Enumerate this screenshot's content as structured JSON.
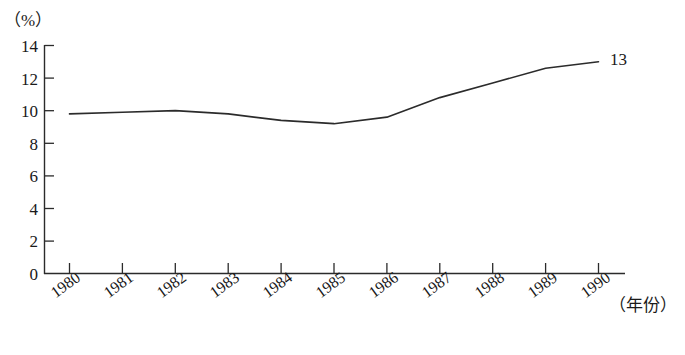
{
  "chart_data": {
    "type": "line",
    "title": "",
    "xlabel": "（年份）",
    "ylabel": "（%）",
    "x": [
      1980,
      1981,
      1982,
      1983,
      1984,
      1985,
      1986,
      1987,
      1988,
      1989,
      1990
    ],
    "categories": [
      "1980",
      "1981",
      "1982",
      "1983",
      "1984",
      "1985",
      "1986",
      "1987",
      "1988",
      "1989",
      "1990"
    ],
    "values": [
      9.8,
      9.9,
      10.0,
      9.8,
      9.4,
      9.2,
      9.6,
      10.8,
      11.7,
      12.6,
      13.0
    ],
    "series": [
      {
        "name": "",
        "values": [
          9.8,
          9.9,
          10.0,
          9.8,
          9.4,
          9.2,
          9.6,
          10.8,
          11.7,
          12.6,
          13.0
        ]
      }
    ],
    "ylim": [
      0,
      14
    ],
    "xlim": [
      1980,
      1990
    ],
    "y_ticks": [
      "0",
      "2",
      "4",
      "6",
      "8",
      "10",
      "12",
      "14"
    ],
    "y_tick_values": [
      0,
      2,
      4,
      6,
      8,
      10,
      12,
      14
    ],
    "grid": false,
    "legend": false,
    "legend_position": "none",
    "annotations": [
      {
        "text": "13",
        "x": 1990,
        "y": 13.0
      }
    ],
    "line_color": "#2b2b2b",
    "axis_color": "#2b2b2b",
    "background_color": "#ffffff"
  }
}
